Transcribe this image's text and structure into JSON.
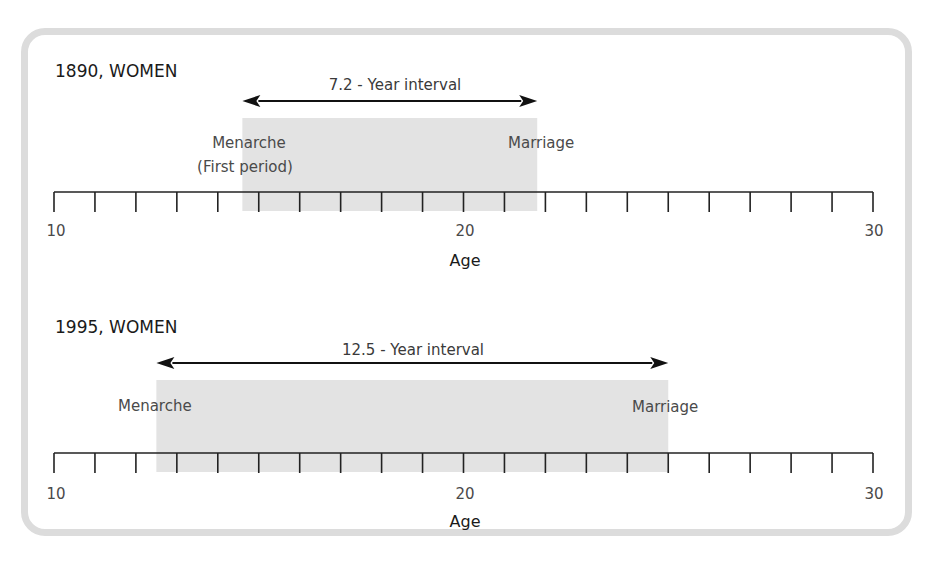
{
  "chart_data": [
    {
      "type": "timeline",
      "title": "1890, WOMEN",
      "xlabel": "Age",
      "xlim": [
        10,
        30
      ],
      "ticks": {
        "major": [
          10,
          20,
          30
        ],
        "minor_step": 1
      },
      "interval": {
        "start": 14.6,
        "end": 21.8,
        "length": 7.2,
        "label": "7.2 - Year interval"
      },
      "events": [
        {
          "name": "Menarche",
          "sublabel": "(First period)",
          "age": 14.6
        },
        {
          "name": "Marriage",
          "age": 21.8
        }
      ]
    },
    {
      "type": "timeline",
      "title": "1995, WOMEN",
      "xlabel": "Age",
      "xlim": [
        10,
        30
      ],
      "ticks": {
        "major": [
          10,
          20,
          30
        ],
        "minor_step": 1
      },
      "interval": {
        "start": 12.5,
        "end": 25.0,
        "length": 12.5,
        "label": "12.5 - Year interval"
      },
      "events": [
        {
          "name": "Menarche",
          "age": 12.5
        },
        {
          "name": "Marriage",
          "age": 25.0
        }
      ]
    }
  ],
  "panels": [
    {
      "title": "1890, WOMEN",
      "interval_label": "7.2 - Year interval",
      "menarche_label": "Menarche",
      "menarche_sublabel": "(First period)",
      "marriage_label": "Marriage",
      "tick_labels": [
        "10",
        "20",
        "30"
      ],
      "axis_title": "Age"
    },
    {
      "title": "1995, WOMEN",
      "interval_label": "12.5 - Year interval",
      "menarche_label": "Menarche",
      "marriage_label": "Marriage",
      "tick_labels": [
        "10",
        "20",
        "30"
      ],
      "axis_title": "Age"
    }
  ],
  "colors": {
    "shade": "#e3e3e3",
    "frame": "#dcdcdc",
    "axis": "#222222",
    "arrow": "#111111"
  }
}
